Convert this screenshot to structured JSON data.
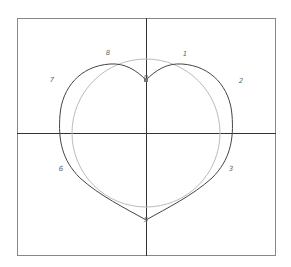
{
  "diagram": {
    "frame": {
      "x": 17,
      "y": 18,
      "w": 258,
      "h": 237,
      "stroke": "#888888"
    },
    "axes": {
      "cx": 146,
      "cy": 133,
      "stroke": "#333333"
    },
    "circle": {
      "cx": 146,
      "cy": 133,
      "r": 74,
      "stroke": "#bbbbbb"
    },
    "heart": {
      "stroke": "#444444",
      "top_cusp": {
        "x": 146,
        "y": 80
      },
      "bottom_tip": {
        "x": 146,
        "y": 220
      }
    },
    "points": [
      {
        "label": "1",
        "x": 185,
        "y": 56
      },
      {
        "label": "2",
        "x": 241,
        "y": 83
      },
      {
        "label": "3",
        "x": 231,
        "y": 171
      },
      {
        "label": "5",
        "x": 146,
        "y": 222
      },
      {
        "label": "6",
        "x": 61,
        "y": 171
      },
      {
        "label": "7",
        "x": 52,
        "y": 82
      },
      {
        "label": "8",
        "x": 108,
        "y": 55
      },
      {
        "label": "0",
        "x": 146,
        "y": 80
      }
    ]
  }
}
